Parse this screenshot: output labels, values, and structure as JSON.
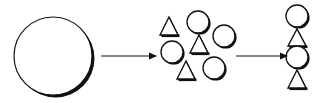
{
  "diagram": {
    "colors": {
      "background": "#ffffff",
      "stroke": "#111111",
      "shadow": "#111111",
      "fill": "#ffffff"
    },
    "stages": [
      {
        "id": "whole",
        "label": "",
        "shapes": [
          {
            "type": "circle",
            "cx": 53,
            "cy": 56,
            "r": 39
          }
        ]
      },
      {
        "id": "scattered-parts",
        "label": "",
        "shapes": [
          {
            "type": "triangle",
            "x": 160,
            "y": 17,
            "w": 18,
            "h": 18
          },
          {
            "type": "circle",
            "cx": 198,
            "cy": 22,
            "r": 11
          },
          {
            "type": "circle",
            "cx": 224,
            "cy": 36,
            "r": 11
          },
          {
            "type": "triangle",
            "x": 190,
            "y": 35,
            "w": 18,
            "h": 18
          },
          {
            "type": "circle",
            "cx": 172,
            "cy": 52,
            "r": 11
          },
          {
            "type": "triangle",
            "x": 177,
            "y": 61,
            "w": 18,
            "h": 18
          },
          {
            "type": "circle",
            "cx": 214,
            "cy": 68,
            "r": 11
          }
        ]
      },
      {
        "id": "ordered-stack",
        "label": "",
        "shapes": [
          {
            "type": "circle",
            "cx": 297,
            "cy": 16,
            "r": 11
          },
          {
            "type": "triangle",
            "x": 288,
            "y": 29,
            "w": 18,
            "h": 17
          },
          {
            "type": "circle",
            "cx": 297,
            "cy": 57,
            "r": 11
          },
          {
            "type": "triangle",
            "x": 288,
            "y": 70,
            "w": 18,
            "h": 18
          }
        ]
      }
    ],
    "arrows": [
      {
        "from": "whole",
        "to": "scattered-parts",
        "x1": 101,
        "y1": 56,
        "x2": 156,
        "y2": 56
      },
      {
        "from": "scattered-parts",
        "to": "ordered-stack",
        "x1": 236,
        "y1": 56,
        "x2": 287,
        "y2": 56
      }
    ]
  }
}
